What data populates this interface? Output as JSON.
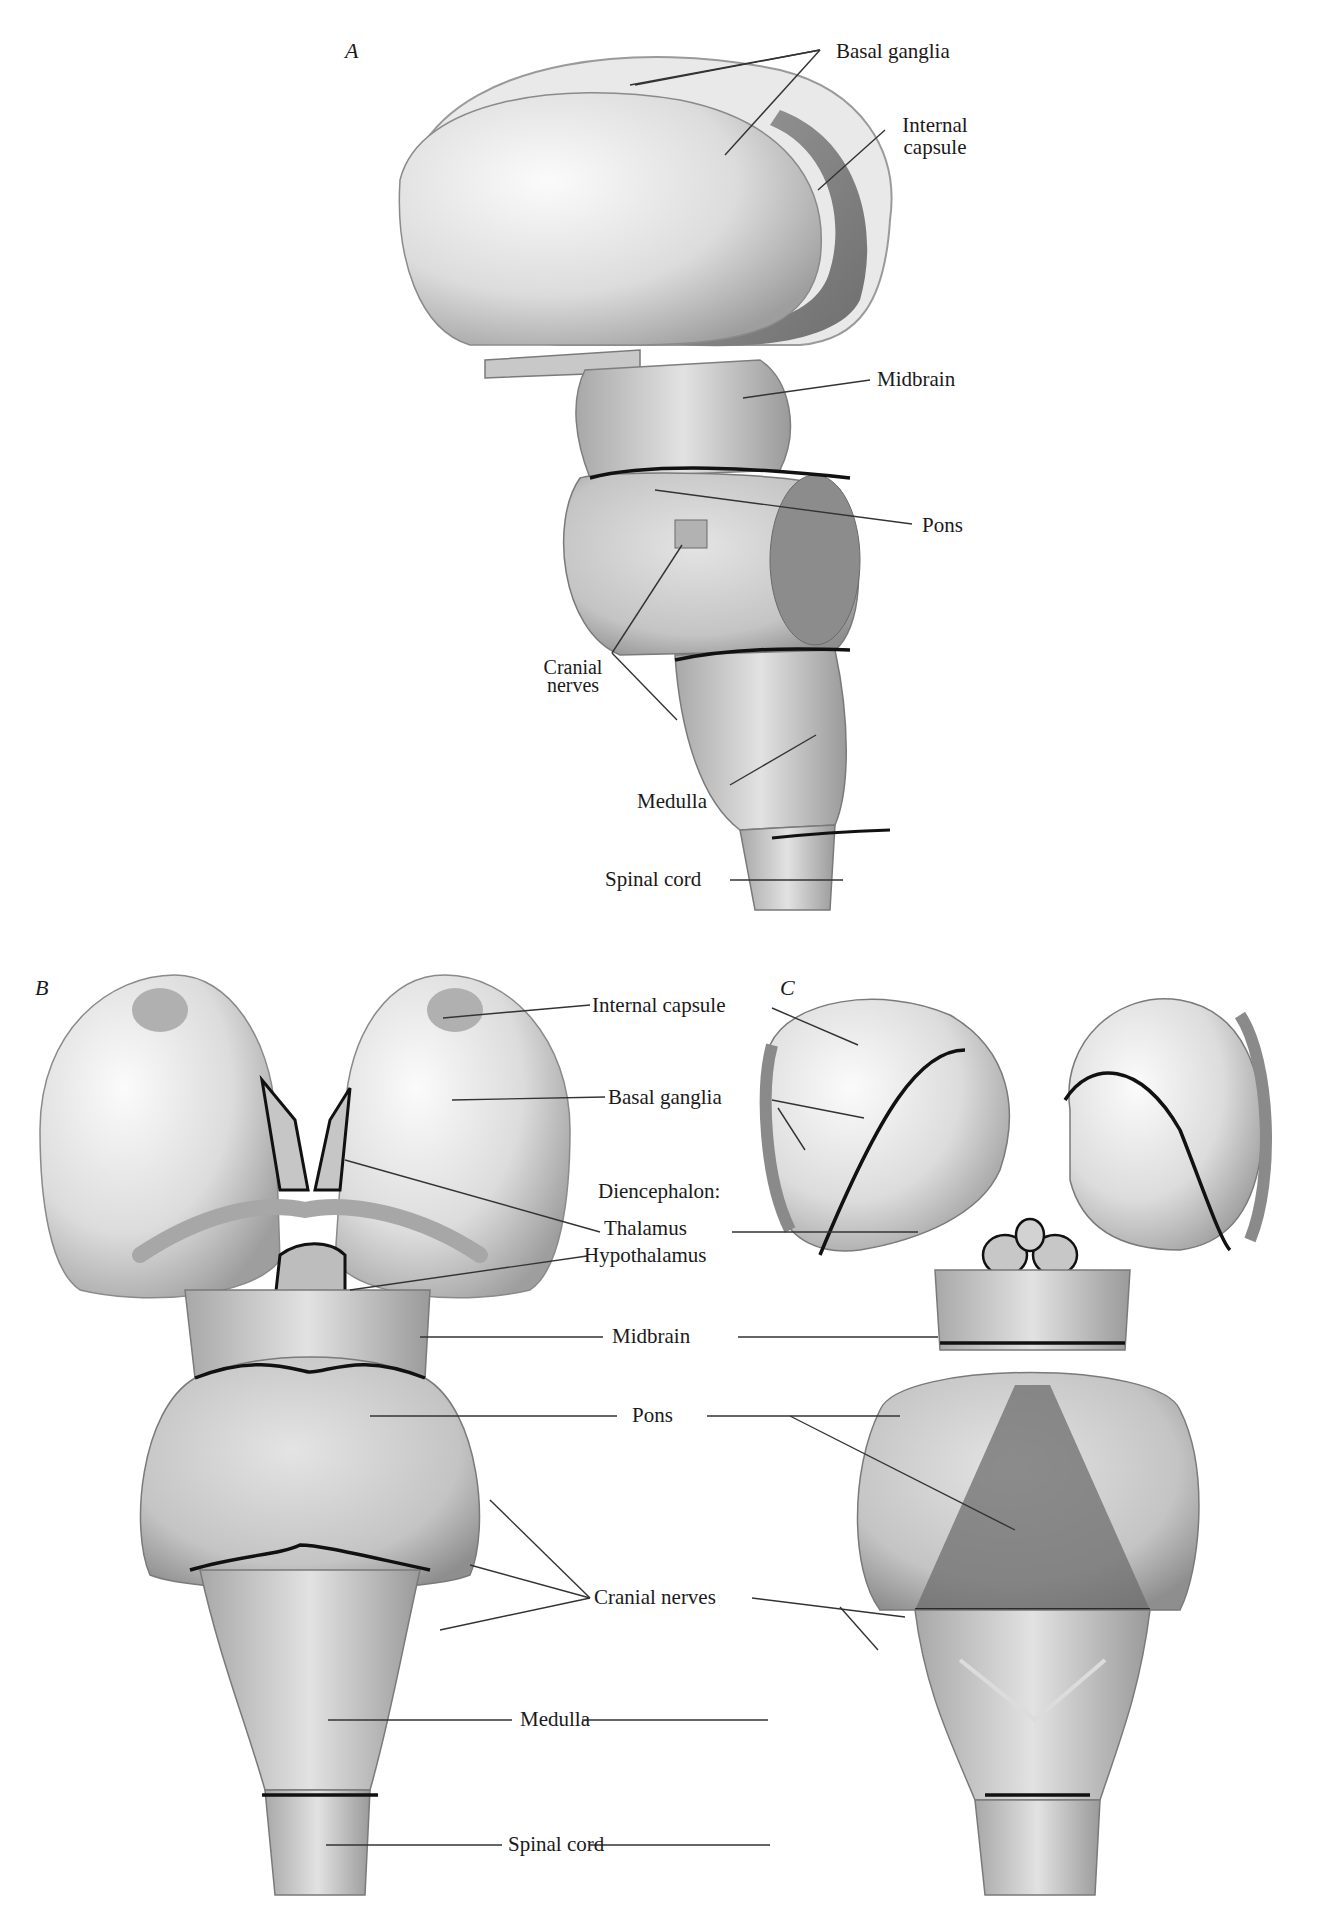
{
  "figure": {
    "panels": [
      {
        "id": "A",
        "letter": "A",
        "view": "lateral",
        "labels": {
          "basal_ganglia": "Basal ganglia",
          "internal_capsule_1": "Internal",
          "internal_capsule_2": "capsule",
          "midbrain": "Midbrain",
          "pons": "Pons",
          "cranial_nerves_1": "Cranial",
          "cranial_nerves_2": "nerves",
          "medulla": "Medulla",
          "spinal_cord": "Spinal cord"
        }
      },
      {
        "id": "B",
        "letter": "B",
        "view": "ventral"
      },
      {
        "id": "C",
        "letter": "C",
        "view": "dorsal"
      }
    ],
    "shared_labels_BC": {
      "internal_capsule": "Internal capsule",
      "basal_ganglia": "Basal ganglia",
      "diencephalon": "Diencephalon:",
      "thalamus": "Thalamus",
      "hypothalamus": "Hypothalamus",
      "midbrain": "Midbrain",
      "pons": "Pons",
      "cranial_nerves": "Cranial nerves",
      "medulla": "Medulla",
      "spinal_cord": "Spinal cord"
    },
    "colors": {
      "background": "#ffffff",
      "tissue_light": "#e6e6e6",
      "tissue_mid": "#bdbdbd",
      "tissue_dark": "#8a8a8a",
      "boundary_line": "#111111",
      "leader_line": "#333333"
    }
  }
}
